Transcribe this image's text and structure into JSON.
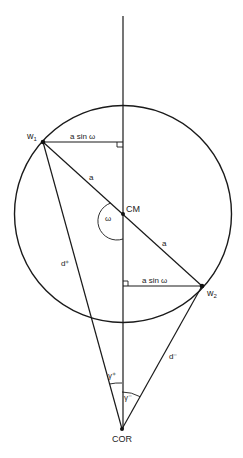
{
  "diagram": {
    "type": "geometric-figure",
    "nodes": {
      "w1": {
        "label": "w",
        "subscript": "1",
        "x": 43,
        "y": 142
      },
      "w2": {
        "label": "w",
        "subscript": "2",
        "x": 202,
        "y": 286
      },
      "cm": {
        "label": "CM",
        "x": 123,
        "y": 214
      },
      "cor": {
        "label": "COR",
        "x": 122,
        "y": 429
      }
    },
    "circle": {
      "cx": 123,
      "cy": 214,
      "r": 108.5
    },
    "axis": {
      "x": 123,
      "y_top": 16,
      "y_bottom": 429
    },
    "labels": {
      "a_sin_omega_top": "a sin ω",
      "a_sin_omega_bottom": "a sin ω",
      "a_upper": "a",
      "a_lower": "a",
      "omega": "ω",
      "d_plus": "d⁺",
      "d_minus": "d⁻",
      "gamma_plus": "γ⁺",
      "gamma_minus": "γ⁻"
    },
    "colors": {
      "stroke": "#1a1a1a",
      "background": "#ffffff"
    }
  }
}
